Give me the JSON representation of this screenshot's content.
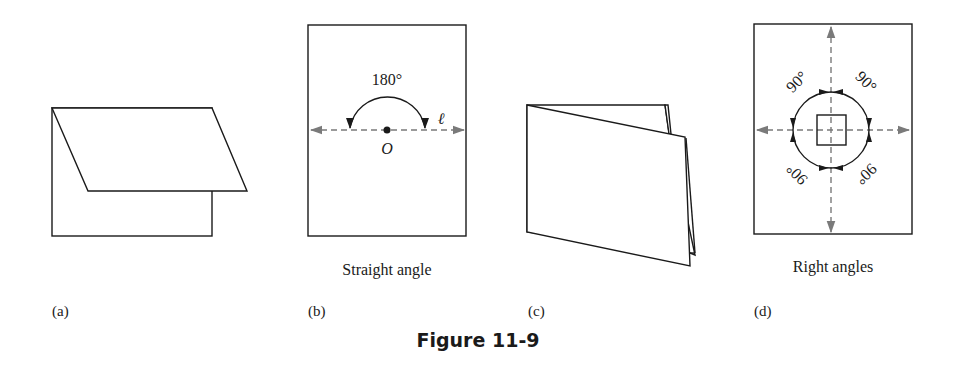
{
  "figure": {
    "title": "Figure 11-9",
    "panels": [
      {
        "id": "a",
        "label": "(a)",
        "caption": ""
      },
      {
        "id": "b",
        "label": "(b)",
        "caption": "Straight angle",
        "angle_label": "180°",
        "point_label": "O",
        "line_label": "ℓ"
      },
      {
        "id": "c",
        "label": "(c)",
        "caption": ""
      },
      {
        "id": "d",
        "label": "(d)",
        "caption": "Right angles",
        "angle_labels": [
          "90°",
          "90°",
          "90°",
          "90°"
        ]
      }
    ]
  },
  "colors": {
    "ink": "#1a1a1a",
    "dashed_line": "#7a7a7a",
    "background": "#ffffff"
  }
}
